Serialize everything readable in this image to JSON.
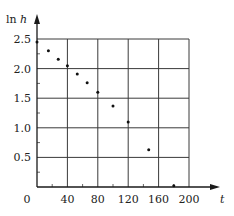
{
  "chart_data": {
    "type": "scatter",
    "title": "",
    "xlabel": "t",
    "ylabel": "ln h",
    "xlim": [
      0,
      200
    ],
    "ylim": [
      0,
      2.5
    ],
    "x_ticks": [
      0,
      40,
      80,
      120,
      160,
      200
    ],
    "x_tick_labels": [
      "0",
      "40",
      "80",
      "120",
      "160",
      "200"
    ],
    "y_ticks": [
      0.5,
      1.0,
      1.5,
      2.0,
      2.5
    ],
    "y_tick_labels": [
      "0.5",
      "1.0",
      "1.5",
      "2.0",
      "2.5"
    ],
    "x_minor_step": 20,
    "y_minor_step": 0.25,
    "grid": true,
    "legend": null,
    "series": [
      {
        "name": "ln h vs t",
        "points": [
          {
            "x": 0,
            "y": 2.45
          },
          {
            "x": 15,
            "y": 2.3
          },
          {
            "x": 28,
            "y": 2.16
          },
          {
            "x": 40,
            "y": 2.05
          },
          {
            "x": 53,
            "y": 1.91
          },
          {
            "x": 66,
            "y": 1.76
          },
          {
            "x": 80,
            "y": 1.6
          },
          {
            "x": 100,
            "y": 1.37
          },
          {
            "x": 120,
            "y": 1.1
          },
          {
            "x": 147,
            "y": 0.63
          },
          {
            "x": 180,
            "y": 0.02
          }
        ]
      }
    ],
    "colors": {
      "point": "#111111",
      "grid": "#3a3a3a",
      "axis": "#1a1a1a"
    }
  }
}
